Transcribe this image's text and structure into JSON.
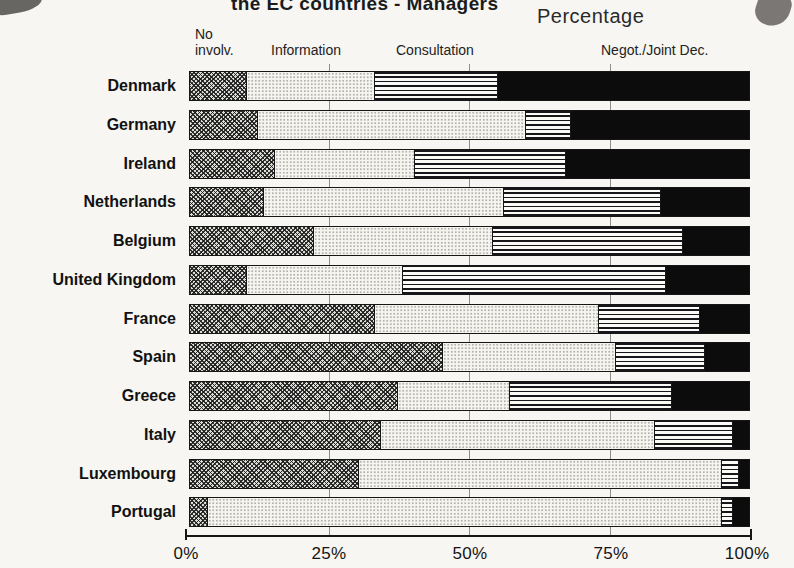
{
  "colors": {
    "ink": "#161616",
    "paper": "#f7f6f2"
  },
  "header": {
    "title": "the EC countries - Managers",
    "axis_top_label": "Percentage"
  },
  "chart_data": {
    "type": "bar",
    "orientation": "horizontal-stacked",
    "title": "the EC countries - Managers",
    "value_axis_label": "Percentage",
    "categories": [
      "Denmark",
      "Germany",
      "Ireland",
      "Netherlands",
      "Belgium",
      "United Kingdom",
      "France",
      "Spain",
      "Greece",
      "Italy",
      "Luxembourg",
      "Portugal"
    ],
    "series": [
      {
        "name": "No involv.",
        "pattern": "dark-crosshatch",
        "values": [
          10,
          12,
          15,
          13,
          22,
          10,
          33,
          45,
          37,
          34,
          30,
          3
        ]
      },
      {
        "name": "Information",
        "pattern": "light-dots",
        "values": [
          23,
          48,
          25,
          43,
          32,
          28,
          40,
          31,
          20,
          49,
          65,
          92
        ]
      },
      {
        "name": "Consultation",
        "pattern": "horizontal-lines",
        "values": [
          22,
          8,
          27,
          28,
          34,
          47,
          18,
          16,
          29,
          14,
          3,
          2
        ]
      },
      {
        "name": "Negot./Joint Dec.",
        "pattern": "solid-black",
        "values": [
          45,
          32,
          33,
          16,
          12,
          15,
          9,
          8,
          14,
          3,
          2,
          3
        ]
      }
    ],
    "x_ticks": [
      "0%",
      "25%",
      "50%",
      "75%",
      "100%"
    ],
    "xlim": [
      0,
      100
    ],
    "legend_position": "top",
    "grid": "tick marks at 25/50/75 visible in gaps between bars"
  }
}
